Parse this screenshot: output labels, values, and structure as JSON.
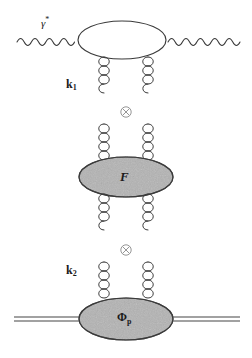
{
  "diagram": {
    "background_color": "#ffffff",
    "line_color": "#3a3a3a",
    "blob_fill_color": "#b3b3b3",
    "blob_stroke_color": "#3a3a3a",
    "labels": {
      "photon_in": "γ",
      "photon_in_superscript": "*",
      "gluon_momentum_top": "k",
      "gluon_momentum_top_subscript": "1",
      "gluon_momentum_bottom": "k",
      "gluon_momentum_bottom_subscript": "2",
      "middle_blob": "F",
      "bottom_blob": "Φ",
      "bottom_blob_subscript": "p",
      "convolution_symbol": "⊗"
    },
    "elements": {
      "photon_line_left": "wavy-photon-line-incoming",
      "photon_line_right": "wavy-photon-line-outgoing",
      "top_blob": "photon-impact-factor-ellipse",
      "gluon_springs_upper": "two-gluon-exchange-upper",
      "gluon_springs_lower": "two-gluon-exchange-lower",
      "middle_blob_shape": "gluon-ladder-ellipse",
      "bottom_blob_shape": "proton-wavefunction-ellipse",
      "proton_line": "double-proton-line",
      "convolution_top": "convolution-operator-upper",
      "convolution_bottom": "convolution-operator-lower"
    }
  }
}
